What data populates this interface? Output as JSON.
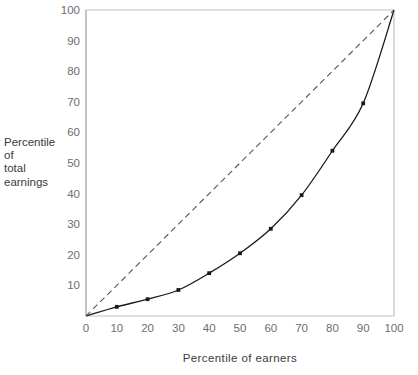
{
  "chart_data": {
    "type": "line",
    "title": "",
    "xlabel": "Percentile  of  earners",
    "ylabel": "Percentile\nof\ntotal\nearnings",
    "xlim": [
      0,
      100
    ],
    "ylim": [
      0,
      100
    ],
    "grid": false,
    "legend": "none",
    "x_ticks": [
      "0",
      "10",
      "20",
      "30",
      "40",
      "50",
      "60",
      "70",
      "80",
      "90",
      "100"
    ],
    "y_ticks": [
      "10",
      "20",
      "30",
      "40",
      "50",
      "60",
      "70",
      "80",
      "90",
      "100"
    ],
    "x": [
      0,
      10,
      20,
      30,
      40,
      50,
      60,
      70,
      80,
      90,
      100
    ],
    "series": [
      {
        "name": "Lorenz curve",
        "style": "solid",
        "color": "#1a1a1a",
        "markers": true,
        "values": [
          0,
          3,
          5.5,
          8.5,
          14,
          20.5,
          28.5,
          39.5,
          54,
          69.5,
          100
        ]
      },
      {
        "name": "Line of equality",
        "style": "dashed",
        "color": "#555555",
        "markers": false,
        "values": [
          0,
          10,
          20,
          30,
          40,
          50,
          60,
          70,
          80,
          90,
          100
        ]
      }
    ]
  },
  "axes": {
    "y_label_lines": [
      "Percentile",
      "of",
      "total",
      "earnings"
    ],
    "x_label_text": "Percentile  of  earners"
  }
}
